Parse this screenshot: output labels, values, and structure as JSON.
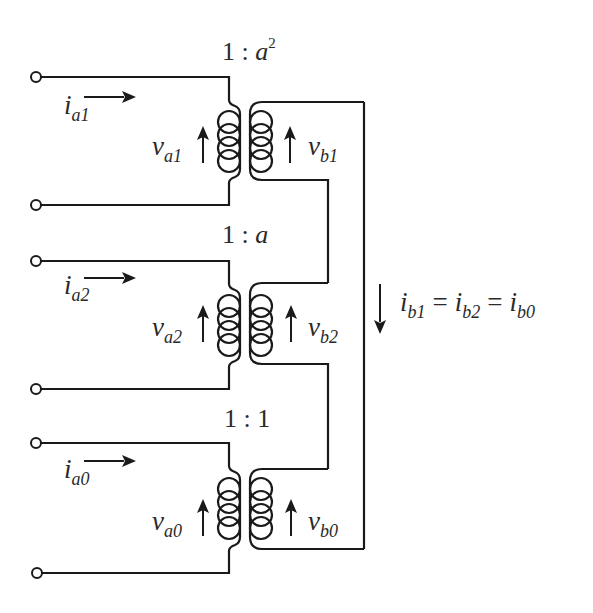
{
  "diagram": {
    "colors": {
      "stroke": "#1a1a1a",
      "text": "#2a2a2a",
      "background": "#ffffff"
    },
    "transformers": [
      {
        "id": "T1",
        "ratio": {
          "left": "1",
          "sep": ":",
          "var": "a",
          "exp": "2"
        },
        "primary_current": {
          "base": "i",
          "sub": "a1"
        },
        "primary_voltage": {
          "base": "v",
          "sub": "a1"
        },
        "secondary_voltage": {
          "base": "v",
          "sub": "b1"
        }
      },
      {
        "id": "T2",
        "ratio": {
          "left": "1",
          "sep": ":",
          "var": "a",
          "exp": ""
        },
        "primary_current": {
          "base": "i",
          "sub": "a2"
        },
        "primary_voltage": {
          "base": "v",
          "sub": "a2"
        },
        "secondary_voltage": {
          "base": "v",
          "sub": "b2"
        }
      },
      {
        "id": "T0",
        "ratio": {
          "left": "1",
          "sep": ":",
          "var": "1",
          "exp": ""
        },
        "primary_current": {
          "base": "i",
          "sub": "a0"
        },
        "primary_voltage": {
          "base": "v",
          "sub": "a0"
        },
        "secondary_voltage": {
          "base": "v",
          "sub": "b0"
        }
      }
    ],
    "loop_current": {
      "terms": [
        {
          "base": "i",
          "sub": "b1"
        },
        {
          "base": "i",
          "sub": "b2"
        },
        {
          "base": "i",
          "sub": "b0"
        }
      ],
      "op": "="
    },
    "terminal_count": 6
  }
}
